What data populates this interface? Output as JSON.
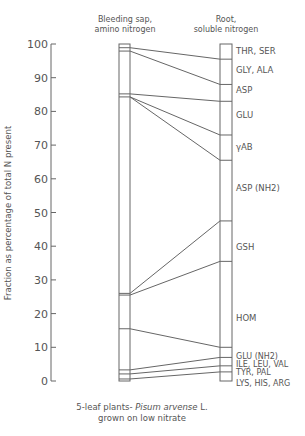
{
  "chart_data": {
    "type": "bar",
    "subtype": "stacked-column-comparison",
    "title": "",
    "ylabel": "Fraction as percentage of total N present",
    "xlabel": "",
    "ylim": [
      0,
      100
    ],
    "yticks": [
      0,
      10,
      20,
      30,
      40,
      50,
      60,
      70,
      80,
      90,
      100
    ],
    "grid": false,
    "columns": [
      {
        "name": "Bleeding sap, amino nitrogen",
        "label_line1": "Bleeding sap,",
        "label_line2": "amino nitrogen",
        "boundaries": [
          0,
          0.6,
          2.1,
          3.3,
          15.5,
          25.5,
          26.0,
          84.3,
          85.2,
          97.9,
          98.9,
          100
        ]
      },
      {
        "name": "Root, soluble nitrogen",
        "label_line1": "Root,",
        "label_line2": "soluble nitrogen",
        "boundaries": [
          0,
          2.7,
          4.5,
          7.0,
          10.0,
          35.5,
          47.5,
          65.5,
          73.0,
          83.0,
          88.0,
          95.5,
          100
        ]
      }
    ],
    "categories": [
      "LYS, HIS, ARG",
      "TYR, PAL",
      "ILE, LEU, VAL",
      "GLU (NH2)",
      "HOM",
      "GSH",
      "ASP (NH2)",
      "γAB",
      "GLU",
      "ASP",
      "GLY, ALA",
      "THR, SER"
    ],
    "series": [
      {
        "name": "Root, soluble nitrogen",
        "values": [
          2.7,
          1.8,
          2.5,
          3.0,
          25.5,
          12.0,
          18.0,
          7.5,
          10.0,
          5.0,
          7.5,
          4.5
        ]
      }
    ],
    "connectors": [
      {
        "from": 98.9,
        "to": 95.5
      },
      {
        "from": 97.9,
        "to": 88.0
      },
      {
        "from": 85.2,
        "to": 83.0
      },
      {
        "from": 84.3,
        "to": 73.0
      },
      {
        "from": 84.3,
        "to": 65.5
      },
      {
        "from": 26.0,
        "to": 47.5
      },
      {
        "from": 25.5,
        "to": 35.5
      },
      {
        "from": 15.5,
        "to": 10.0
      },
      {
        "from": 3.3,
        "to": 7.0
      },
      {
        "from": 2.1,
        "to": 4.5
      },
      {
        "from": 0.6,
        "to": 2.7
      }
    ],
    "caption_line1_prefix": "5-leaf plants- ",
    "caption_species": "Pisum arvense",
    "caption_line1_suffix": " L.",
    "caption_line2": "grown on low nitrate"
  }
}
